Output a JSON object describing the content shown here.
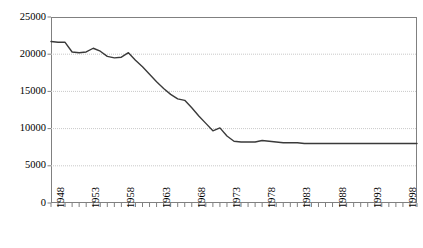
{
  "chart_data": {
    "type": "line",
    "title": "",
    "subtitle": "",
    "xlabel": "",
    "ylabel": "",
    "xlim": [
      1948,
      2000
    ],
    "ylim": [
      0,
      25000
    ],
    "grid": true,
    "grid_axis": "y",
    "legend": false,
    "legend_position": "none",
    "y_ticks": [
      0,
      5000,
      10000,
      15000,
      20000,
      25000
    ],
    "y_tick_labels": [
      "0",
      "5000",
      "10000",
      "15000",
      "20000",
      "25000"
    ],
    "x_ticks": [
      1948,
      1953,
      1958,
      1963,
      1968,
      1973,
      1978,
      1983,
      1988,
      1993,
      1998
    ],
    "x_tick_labels": [
      "1948",
      "1953",
      "1958",
      "1963",
      "1968",
      "1973",
      "1978",
      "1983",
      "1988",
      "1993",
      "1998"
    ],
    "x_minor_ticks_every": 1,
    "line_color": "#3a3a3a",
    "line_width": 1.4,
    "markers": false,
    "x": [
      1948,
      1949,
      1950,
      1951,
      1952,
      1953,
      1954,
      1955,
      1956,
      1957,
      1958,
      1959,
      1960,
      1961,
      1962,
      1963,
      1964,
      1965,
      1966,
      1967,
      1968,
      1969,
      1970,
      1971,
      1972,
      1973,
      1974,
      1975,
      1976,
      1977,
      1978,
      1979,
      1980,
      1981,
      1982,
      1983,
      1984,
      1985,
      1986,
      1987,
      1988,
      1989,
      1990,
      1991,
      1992,
      1993,
      1994,
      1995,
      1996,
      1997,
      1998,
      1999,
      2000
    ],
    "series": [
      {
        "name": "series-1",
        "values": [
          21700,
          21600,
          21600,
          20300,
          20200,
          20300,
          20800,
          20400,
          19700,
          19500,
          19600,
          20200,
          19200,
          18300,
          17300,
          16300,
          15400,
          14600,
          14000,
          13800,
          12800,
          11700,
          10700,
          9700,
          10100,
          9000,
          8300,
          8200,
          8200,
          8200,
          8400,
          8300,
          8200,
          8100,
          8100,
          8100,
          8000,
          8000,
          8000,
          8000,
          8000,
          8000,
          8000,
          8000,
          8000,
          8000,
          8000,
          8000,
          8000,
          8000,
          8000,
          8000,
          8000
        ]
      }
    ]
  }
}
